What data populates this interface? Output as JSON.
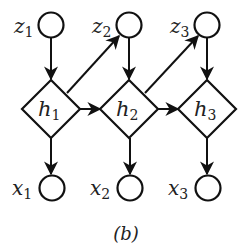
{
  "caption": "(b)",
  "colors": {
    "stroke": "#111111",
    "text": "#222222",
    "background": "#ffffff"
  },
  "nodes": {
    "z": [
      {
        "var": "z",
        "sub": "1",
        "shape": "circle"
      },
      {
        "var": "z",
        "sub": "2",
        "shape": "circle"
      },
      {
        "var": "z",
        "sub": "3",
        "shape": "circle"
      }
    ],
    "h": [
      {
        "var": "h",
        "sub": "1",
        "shape": "diamond"
      },
      {
        "var": "h",
        "sub": "2",
        "shape": "diamond"
      },
      {
        "var": "h",
        "sub": "3",
        "shape": "diamond"
      }
    ],
    "x": [
      {
        "var": "x",
        "sub": "1",
        "shape": "circle"
      },
      {
        "var": "x",
        "sub": "2",
        "shape": "circle"
      },
      {
        "var": "x",
        "sub": "3",
        "shape": "circle"
      }
    ]
  },
  "edges": [
    {
      "from": "z1",
      "to": "h1"
    },
    {
      "from": "z2",
      "to": "h2"
    },
    {
      "from": "z3",
      "to": "h3"
    },
    {
      "from": "h1",
      "to": "z2"
    },
    {
      "from": "h2",
      "to": "z3"
    },
    {
      "from": "h1",
      "to": "h2"
    },
    {
      "from": "h2",
      "to": "h3"
    },
    {
      "from": "h1",
      "to": "x1"
    },
    {
      "from": "h2",
      "to": "x2"
    },
    {
      "from": "h3",
      "to": "x3"
    }
  ]
}
